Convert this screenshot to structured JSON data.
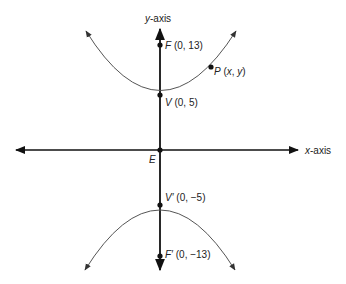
{
  "diagram": {
    "type": "hyperbola",
    "axes": {
      "x_label_var": "x",
      "x_label_suffix": "-axis",
      "y_label_var": "y",
      "y_label_suffix": "-axis"
    },
    "origin": {
      "label": "E"
    },
    "points": {
      "focus_top": {
        "name": "F",
        "coords": " (0, 13)"
      },
      "vertex_top": {
        "name": "V",
        "coords": " (0, 5)"
      },
      "point_p": {
        "name": "P",
        "coords_open": " (",
        "x": "x",
        "sep": ", ",
        "y": "y",
        "coords_close": ")"
      },
      "vertex_bottom": {
        "name": "V′",
        "coords": " (0, −5)"
      },
      "focus_bottom": {
        "name": "F′",
        "coords": " (0, −13)"
      }
    },
    "colors": {
      "axis": "#111111",
      "curve": "#555555",
      "point": "#111111"
    }
  }
}
